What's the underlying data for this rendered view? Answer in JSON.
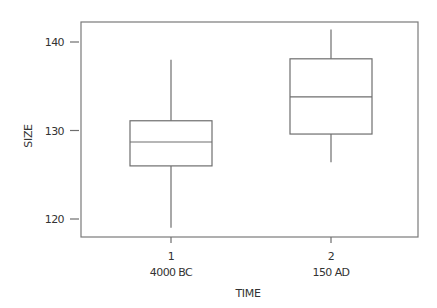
{
  "chart_data": {
    "type": "boxplot",
    "title": "",
    "xlabel": "TIME",
    "ylabel": "SIZE",
    "ylim": [
      117.8,
      142.2
    ],
    "yticks": [
      120,
      130,
      140
    ],
    "ytick_labels": [
      "120",
      "130",
      "140"
    ],
    "grid": false,
    "legend": "none",
    "categories": [
      {
        "code": "1",
        "label": "4000 BC"
      },
      {
        "code": "2",
        "label": "150 AD"
      }
    ],
    "boxes": [
      {
        "name": "4000 BC",
        "whisker_low": 119.0,
        "q1": 126.0,
        "median": 128.7,
        "q3": 131.1,
        "whisker_high": 138.0
      },
      {
        "name": "150 AD",
        "whisker_low": 126.4,
        "q1": 129.6,
        "median": 133.8,
        "q3": 138.1,
        "whisker_high": 141.4
      }
    ]
  }
}
